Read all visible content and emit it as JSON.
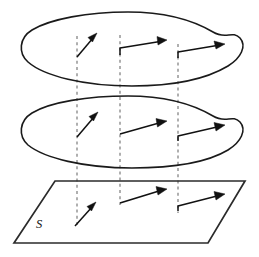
{
  "figure": {
    "colors": {
      "outline": "#1a1a1a",
      "plane_outline": "#2b2b2b",
      "dashed_guide": "#6e6e6e",
      "vector": "#111111",
      "background": "#ffffff"
    },
    "labels": {
      "surface_label": "S"
    },
    "layers": [
      {
        "name": "top-blob",
        "type": "closed-curve",
        "center": [
          132,
          48
        ],
        "bbox": [
          22,
          12,
          242,
          86
        ]
      },
      {
        "name": "middle-blob",
        "type": "closed-curve",
        "center": [
          132,
          130
        ],
        "bbox": [
          22,
          96,
          242,
          168
        ]
      },
      {
        "name": "base-plane",
        "type": "parallelogram",
        "corners": [
          [
            55,
            181
          ],
          [
            245,
            181
          ],
          [
            208,
            243
          ],
          [
            14,
            243
          ]
        ],
        "label": "S"
      }
    ],
    "guides": {
      "name": "dashed-projection-lines",
      "count": 3,
      "x_positions": [
        77,
        120,
        178
      ],
      "y_span": [
        35,
        228
      ]
    },
    "vectors": [
      {
        "layer": "top-blob",
        "index": 1,
        "tail": [
          77,
          57
        ],
        "tip": [
          97,
          33
        ]
      },
      {
        "layer": "top-blob",
        "index": 2,
        "tail": [
          120,
          55
        ],
        "tip": [
          166,
          40
        ]
      },
      {
        "layer": "top-blob",
        "index": 3,
        "tail": [
          178,
          58
        ],
        "tip": [
          224,
          44
        ]
      },
      {
        "layer": "middle-blob",
        "index": 1,
        "tail": [
          77,
          137
        ],
        "tip": [
          98,
          112
        ]
      },
      {
        "layer": "middle-blob",
        "index": 2,
        "tail": [
          120,
          134
        ],
        "tip": [
          166,
          122
        ]
      },
      {
        "layer": "middle-blob",
        "index": 3,
        "tail": [
          178,
          141
        ],
        "tip": [
          224,
          125
        ]
      },
      {
        "layer": "base-plane",
        "index": 1,
        "tail": [
          75,
          226
        ],
        "tip": [
          96,
          202
        ]
      },
      {
        "layer": "base-plane",
        "index": 2,
        "tail": [
          120,
          203
        ],
        "tip": [
          166,
          189
        ]
      },
      {
        "layer": "base-plane",
        "index": 3,
        "tail": [
          178,
          211
        ],
        "tip": [
          224,
          194
        ]
      }
    ]
  }
}
